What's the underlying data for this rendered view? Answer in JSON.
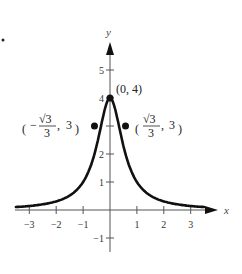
{
  "chart_data": {
    "type": "line",
    "title": "",
    "xlabel": "x",
    "ylabel": "y",
    "xlim": [
      -3.5,
      3.5
    ],
    "ylim": [
      -1.5,
      5.5
    ],
    "grid": false,
    "function": "y = 4/(1+3x^2)",
    "x_ticks": [
      -3,
      -2,
      -1,
      1,
      2,
      3
    ],
    "x_tick_labels": [
      "−3",
      "−2",
      "−1",
      "1",
      "2",
      "3"
    ],
    "y_ticks": [
      -1,
      1,
      2,
      3,
      4,
      5
    ],
    "y_tick_labels": [
      "−1",
      "1",
      "2",
      "",
      "4",
      "5"
    ],
    "series": [
      {
        "name": "curve",
        "x": [
          -3.5,
          -3,
          -2.5,
          -2,
          -1.5,
          -1,
          -0.75,
          -0.57735,
          -0.5,
          -0.25,
          0,
          0.25,
          0.5,
          0.57735,
          0.75,
          1,
          1.5,
          2,
          2.5,
          3,
          3.5
        ],
        "values": [
          0.106,
          0.143,
          0.203,
          0.308,
          0.516,
          1.0,
          1.488,
          2.0,
          2.286,
          3.368,
          4.0,
          3.368,
          2.286,
          2.0,
          1.488,
          1.0,
          0.516,
          0.308,
          0.203,
          0.143,
          0.106
        ]
      }
    ],
    "points": [
      {
        "x": 0,
        "y": 4,
        "label": "(0, 4)"
      },
      {
        "x": -0.57735,
        "y": 3,
        "label": "(−√3/3, 3)"
      },
      {
        "x": 0.57735,
        "y": 3,
        "label": "(√3/3, 3)"
      }
    ],
    "annotations": {
      "top": "(0, 4)",
      "left_num": "√3",
      "left_den": "3",
      "left_y": "3",
      "right_num": "√3",
      "right_den": "3",
      "right_y": "3"
    }
  }
}
